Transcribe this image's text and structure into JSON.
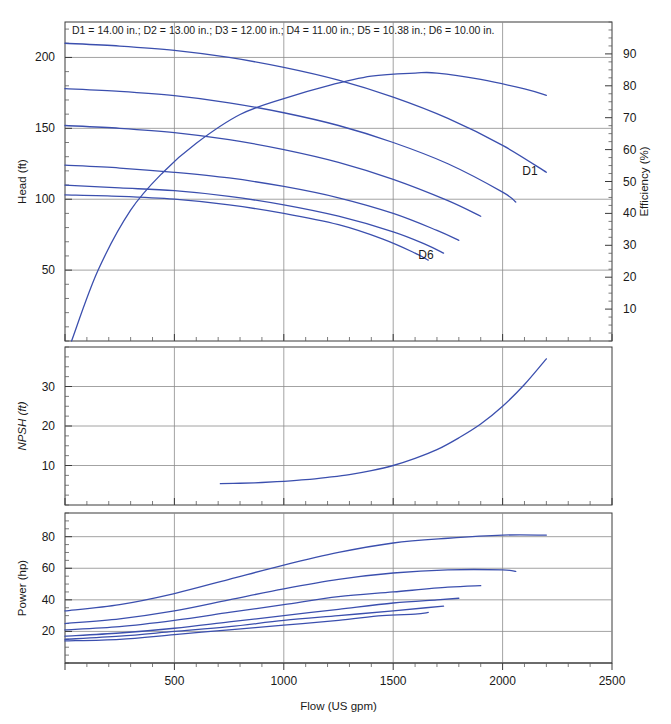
{
  "figure": {
    "header": "D1 = 14.00 in.; D2 = 13.00 in.; D3 = 12.00 in.; D4 = 11.00 in.; D5 = 10.38 in.; D6 = 10.00 in.",
    "curve_color": "#3b4fae",
    "grid_color": "#8c8c8c",
    "frame_color": "#3a3a3a",
    "xlabel": "Flow (US gpm)",
    "label_d1": "D1",
    "label_d6": "D6"
  },
  "chart_data": [
    {
      "type": "line",
      "panel": "head-efficiency",
      "title": "D1 = 14.00 in.; D2 = 13.00 in.; D3 = 12.00 in.; D4 = 11.00 in.; D5 = 10.38 in.; D6 = 10.00 in.",
      "xlabel": "Flow (US gpm)",
      "ylabel": "Head (ft)",
      "y2label": "Efficiency (%)",
      "xlim": [
        0,
        2500
      ],
      "ylim": [
        0,
        225
      ],
      "y2lim": [
        0,
        100
      ],
      "xticks": [
        0,
        500,
        1000,
        1500,
        2000,
        2500
      ],
      "xticklabels": [
        "",
        "500",
        "1000",
        "1500",
        "2000",
        "2500"
      ],
      "yticks": [
        50,
        100,
        150,
        200
      ],
      "yticklabels": [
        "50",
        "100",
        "150",
        "200"
      ],
      "y2ticks": [
        10,
        20,
        30,
        40,
        50,
        60,
        70,
        80,
        90
      ],
      "y2ticklabels": [
        "10",
        "20",
        "30",
        "40",
        "50",
        "60",
        "70",
        "80",
        "90"
      ],
      "grid": true,
      "legend": "inline-annotations",
      "annotations": [
        {
          "text": "D1",
          "x": 2090,
          "y": 117
        },
        {
          "text": "D6",
          "x": 1615,
          "y": 58
        }
      ],
      "series": [
        {
          "name": "D1",
          "impeller_in": 14.0,
          "axis": "left",
          "x": [
            0,
            250,
            500,
            750,
            1000,
            1250,
            1500,
            1750,
            2000,
            2200
          ],
          "y": [
            210,
            208,
            205,
            200,
            193,
            184,
            172,
            157,
            138,
            119
          ]
        },
        {
          "name": "D2",
          "impeller_in": 13.0,
          "axis": "left",
          "x": [
            0,
            250,
            500,
            750,
            1000,
            1250,
            1500,
            1750,
            2000,
            2060
          ],
          "y": [
            178,
            176,
            173,
            168,
            161,
            152,
            140,
            125,
            105,
            98
          ]
        },
        {
          "name": "D3",
          "impeller_in": 12.0,
          "axis": "left",
          "x": [
            0,
            250,
            500,
            750,
            1000,
            1250,
            1500,
            1750,
            1900
          ],
          "y": [
            152,
            150,
            147,
            142,
            135,
            126,
            114,
            99,
            88
          ]
        },
        {
          "name": "D4",
          "impeller_in": 11.0,
          "axis": "left",
          "x": [
            0,
            250,
            500,
            750,
            1000,
            1250,
            1500,
            1700,
            1800
          ],
          "y": [
            124,
            122,
            119,
            115,
            109,
            101,
            90,
            78,
            71
          ]
        },
        {
          "name": "D5",
          "impeller_in": 10.38,
          "axis": "left",
          "x": [
            0,
            250,
            500,
            750,
            1000,
            1250,
            1500,
            1650,
            1730
          ],
          "y": [
            110,
            108,
            106,
            102,
            96,
            88,
            77,
            68,
            62
          ]
        },
        {
          "name": "D6",
          "impeller_in": 10.0,
          "axis": "left",
          "x": [
            0,
            250,
            500,
            750,
            1000,
            1250,
            1450,
            1600,
            1660
          ],
          "y": [
            103,
            102,
            100,
            96,
            90,
            82,
            72,
            62,
            57
          ]
        },
        {
          "name": "Efficiency",
          "axis": "right",
          "x": [
            30,
            150,
            300,
            450,
            600,
            800,
            1000,
            1200,
            1400,
            1600,
            1700,
            1900,
            2100,
            2200
          ],
          "y": [
            0,
            22,
            41,
            53,
            62,
            71,
            76,
            80,
            83,
            84,
            84,
            82,
            79,
            77
          ]
        }
      ]
    },
    {
      "type": "line",
      "panel": "npsh",
      "ylabel": "NPSH (ft)",
      "xlim": [
        0,
        2500
      ],
      "ylim": [
        0,
        40
      ],
      "xticks": [
        0,
        500,
        1000,
        1500,
        2000,
        2500
      ],
      "yticks": [
        10,
        20,
        30
      ],
      "yticklabels": [
        "10",
        "20",
        "30"
      ],
      "grid": true,
      "series": [
        {
          "name": "NPSHr",
          "x": [
            710,
            800,
            900,
            1000,
            1100,
            1200,
            1300,
            1400,
            1500,
            1600,
            1700,
            1800,
            1900,
            2000,
            2100,
            2200
          ],
          "y": [
            5.4,
            5.5,
            5.7,
            6.0,
            6.4,
            7.0,
            7.7,
            8.7,
            10.0,
            11.8,
            14.0,
            17.0,
            20.5,
            25.0,
            30.5,
            37.0
          ]
        }
      ]
    },
    {
      "type": "line",
      "panel": "power",
      "ylabel": "Power (hp)",
      "xlabel": "Flow (US gpm)",
      "xlim": [
        0,
        2500
      ],
      "ylim": [
        0,
        95
      ],
      "xticks": [
        0,
        500,
        1000,
        1500,
        2000,
        2500
      ],
      "xticklabels": [
        "",
        "500",
        "1000",
        "1500",
        "2000",
        "2500"
      ],
      "yticks": [
        20,
        40,
        60,
        80
      ],
      "yticklabels": [
        "20",
        "40",
        "60",
        "80"
      ],
      "grid": true,
      "series": [
        {
          "name": "D1",
          "impeller_in": 14.0,
          "x": [
            0,
            250,
            500,
            750,
            1000,
            1250,
            1500,
            1750,
            2000,
            2200
          ],
          "y": [
            33,
            37,
            44,
            53,
            62,
            70,
            76,
            79,
            81,
            81
          ]
        },
        {
          "name": "D2",
          "impeller_in": 13.0,
          "x": [
            0,
            250,
            500,
            750,
            1000,
            1250,
            1500,
            1750,
            2000,
            2060
          ],
          "y": [
            25,
            28,
            33,
            40,
            47,
            53,
            57,
            59,
            59,
            58
          ]
        },
        {
          "name": "D3",
          "impeller_in": 12.0,
          "x": [
            0,
            250,
            500,
            750,
            1000,
            1250,
            1500,
            1750,
            1900
          ],
          "y": [
            21,
            23,
            27,
            32,
            37,
            42,
            45,
            48,
            49
          ]
        },
        {
          "name": "D4",
          "impeller_in": 11.0,
          "x": [
            0,
            250,
            500,
            750,
            1000,
            1250,
            1500,
            1700,
            1800
          ],
          "y": [
            17,
            19,
            22,
            26,
            30,
            34,
            38,
            40,
            41
          ]
        },
        {
          "name": "D5",
          "impeller_in": 10.38,
          "x": [
            0,
            250,
            500,
            750,
            1000,
            1250,
            1500,
            1650,
            1730
          ],
          "y": [
            15,
            17,
            20,
            23,
            27,
            30,
            33,
            35,
            36
          ]
        },
        {
          "name": "D6",
          "impeller_in": 10.0,
          "x": [
            0,
            250,
            500,
            750,
            1000,
            1250,
            1450,
            1600,
            1660
          ],
          "y": [
            14,
            15,
            18,
            21,
            24,
            27,
            30,
            31,
            32
          ]
        }
      ]
    }
  ]
}
